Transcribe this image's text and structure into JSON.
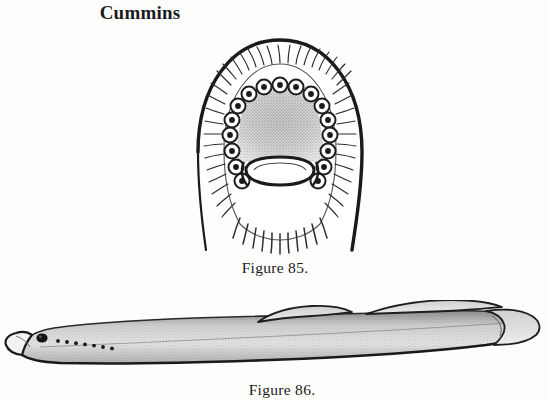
{
  "page": {
    "running_head": "Cummins",
    "paper_color": "#fdfdfc",
    "ink_color": "#1a1a1a"
  },
  "figures": [
    {
      "id": "figure-85",
      "caption": "Figure 85.",
      "subject": "lamprey-oral-disc",
      "description": "Ventral view of lamprey oral disc with marginal fringe papillae, ring of circumoral teeth, stippled lingual region and transverse lamina",
      "teeth_count": 14,
      "view": "oral-disc-ventral"
    },
    {
      "id": "figure-86",
      "caption": "Figure 86.",
      "subject": "lamprey-whole-body-lateral",
      "description": "Lateral view of entire lamprey showing eye, seven gill pores, two dorsal fins and caudal fin",
      "gill_pore_count": 7,
      "dorsal_fin_count": 2,
      "view": "lateral"
    }
  ]
}
